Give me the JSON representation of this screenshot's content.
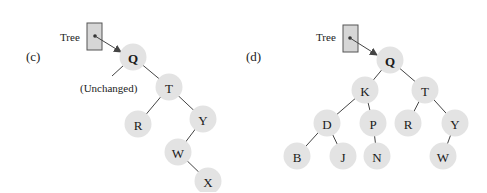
{
  "panels": [
    {
      "id": "c",
      "label": "(c)",
      "pointer_label": "Tree",
      "annotation": "(Unchanged)",
      "root": "Q",
      "nodes": [
        {
          "key": "Q",
          "x": 133,
          "y": 57
        },
        {
          "key": "T",
          "x": 169,
          "y": 87
        },
        {
          "key": "R",
          "x": 138,
          "y": 124
        },
        {
          "key": "Y",
          "x": 203,
          "y": 119
        },
        {
          "key": "W",
          "x": 178,
          "y": 152
        },
        {
          "key": "X",
          "x": 208,
          "y": 181
        }
      ],
      "edges": [
        [
          "Q",
          "T"
        ],
        [
          "T",
          "R"
        ],
        [
          "T",
          "Y"
        ],
        [
          "Y",
          "W"
        ],
        [
          "W",
          "X"
        ]
      ]
    },
    {
      "id": "d",
      "label": "(d)",
      "pointer_label": "Tree",
      "root": "Q",
      "nodes": [
        {
          "key": "Q",
          "x": 390,
          "y": 60
        },
        {
          "key": "K",
          "x": 365,
          "y": 90
        },
        {
          "key": "T",
          "x": 425,
          "y": 90
        },
        {
          "key": "D",
          "x": 327,
          "y": 123
        },
        {
          "key": "P",
          "x": 373,
          "y": 123
        },
        {
          "key": "R",
          "x": 408,
          "y": 123
        },
        {
          "key": "Y",
          "x": 455,
          "y": 123
        },
        {
          "key": "B",
          "x": 297,
          "y": 156
        },
        {
          "key": "J",
          "x": 343,
          "y": 156
        },
        {
          "key": "N",
          "x": 377,
          "y": 156
        },
        {
          "key": "W",
          "x": 443,
          "y": 156
        }
      ],
      "edges": [
        [
          "Q",
          "K"
        ],
        [
          "Q",
          "T"
        ],
        [
          "K",
          "D"
        ],
        [
          "K",
          "P"
        ],
        [
          "T",
          "R"
        ],
        [
          "T",
          "Y"
        ],
        [
          "D",
          "B"
        ],
        [
          "D",
          "J"
        ],
        [
          "P",
          "N"
        ],
        [
          "Y",
          "W"
        ]
      ]
    }
  ],
  "colors": {
    "node_fill": "#e3e3e3",
    "box_fill": "#d6d6d6",
    "edge": "#444444"
  }
}
